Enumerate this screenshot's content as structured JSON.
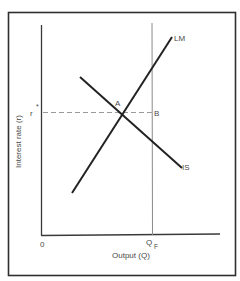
{
  "diagram": {
    "type": "IS-LM",
    "y_axis_label": "Interest rate (r)",
    "x_axis_label": "Output (Q)",
    "origin_label": "0",
    "r_star_label": "r",
    "r_star_superscript": "*",
    "qf_label": "Q",
    "qf_subscript": "F",
    "curves": {
      "lm_label": "LM",
      "is_label": "IS"
    },
    "points": {
      "a_label": "A",
      "b_label": "B"
    }
  },
  "colors": {
    "frame": "#2f2f2f",
    "axis": "#3a3a3a",
    "curve": "#222222",
    "qf_line": "#8a8a8a",
    "dashed": "#9a9a9a",
    "text": "#4a4a4a"
  }
}
